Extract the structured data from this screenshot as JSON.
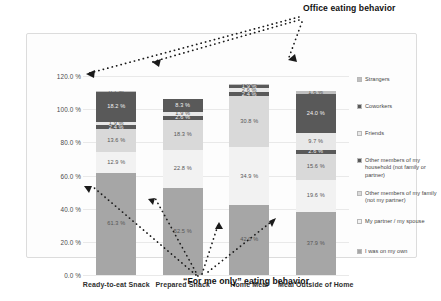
{
  "chart_data": {
    "type": "bar",
    "stacked": true,
    "title": "",
    "xlabel": "",
    "ylabel": "",
    "ylim": [
      0,
      120
    ],
    "ytick_labels": [
      "0.0 %",
      "20.0 %",
      "40.0 %",
      "60.0 %",
      "80.0 %",
      "100.0 %",
      "120.0 %"
    ],
    "ytick_values": [
      0,
      20,
      40,
      60,
      80,
      100,
      120
    ],
    "grid": true,
    "legend_position": "right",
    "categories": [
      "Ready-to-eat Snack",
      "Prepared Snack",
      "Home Meal",
      "Meal Outside of Home"
    ],
    "series": [
      {
        "name": "I was on my own",
        "color": "#a6a6a6",
        "values": [
          61.3,
          52.5,
          42.0,
          37.9
        ]
      },
      {
        "name": "My partner / my spouse",
        "color": "#f2f2f2",
        "values": [
          12.9,
          22.8,
          34.9,
          19.6
        ]
      },
      {
        "name": "Other members of my family (not my partner)",
        "color": "#d9d9d9",
        "values": [
          13.6,
          18.3,
          30.8,
          15.6
        ]
      },
      {
        "name": "Other members of my household (not family or partner)",
        "color": "#595959",
        "values": [
          2.4,
          2.6,
          2.4,
          2.6
        ]
      },
      {
        "name": "Friends",
        "color": "#e8e8e8",
        "values": [
          1.9,
          1.9,
          2.6,
          9.7
        ]
      },
      {
        "name": "Coworkers",
        "color": "#595959",
        "values": [
          18.2,
          8.3,
          1.9,
          24.0
        ]
      },
      {
        "name": "Strangers",
        "color": "#bfbfbf",
        "values": [
          0.7,
          0.0,
          0.6,
          1.6
        ]
      }
    ],
    "bar_labels": [
      [
        "61.3 %",
        "12.9 %",
        "13.6 %",
        "2.4 %",
        "1.9 %",
        "18.2 %",
        "0.7 %"
      ],
      [
        "52.5 %",
        "22.8 %",
        "18.3 %",
        "2.6 %",
        "1.9 %",
        "8.3 %",
        "0.0 %"
      ],
      [
        "42.0 %",
        "34.9 %",
        "30.8 %",
        "2.4 %",
        "2.6 %",
        "1.9 %",
        "0.6 %"
      ],
      [
        "37.9 %",
        "19.6 %",
        "15.6 %",
        "2.6 %",
        "9.7 %",
        "24.0 %",
        "1.6 %"
      ]
    ],
    "annotations": [
      {
        "name": "office-eating-behavior",
        "text": "Office eating behavior"
      },
      {
        "name": "for-me-only-eating-behavior",
        "text": "“For me only” eating behavior"
      }
    ]
  },
  "legend": {
    "items": [
      {
        "label": "Strangers",
        "color": "#bfbfbf"
      },
      {
        "label": "Coworkers",
        "color": "#595959"
      },
      {
        "label": "Friends",
        "color": "#e8e8e8"
      },
      {
        "label": "Other members of my household (not family or partner)",
        "color": "#595959"
      },
      {
        "label": "Other members of my family (not my partner)",
        "color": "#d9d9d9"
      },
      {
        "label": "My partner / my spouse",
        "color": "#f2f2f2"
      },
      {
        "label": "I was on my own",
        "color": "#a6a6a6"
      }
    ]
  }
}
